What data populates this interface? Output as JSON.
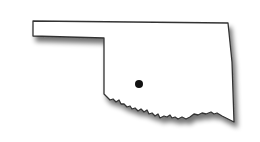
{
  "map": {
    "region": "Oklahoma",
    "outline_color": "#333333",
    "fill_color": "#ffffff",
    "shadow_color": "#9a9a9a",
    "marker": {
      "x": 139,
      "y": 84,
      "r": 4,
      "color": "#111111"
    }
  }
}
